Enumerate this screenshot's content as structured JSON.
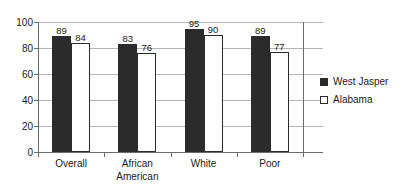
{
  "chart_data": {
    "type": "bar",
    "title": "",
    "subtitle": "",
    "xlabel": "",
    "ylabel": "",
    "categories": [
      "Overall",
      "African American",
      "White",
      "Poor"
    ],
    "category_lines": [
      [
        "Overall"
      ],
      [
        "African",
        "American"
      ],
      [
        "White"
      ],
      [
        "Poor"
      ]
    ],
    "series": [
      {
        "name": "West Jasper",
        "values": [
          89,
          83,
          95,
          89
        ],
        "color": "#2b2b2b",
        "swatch": "filled"
      },
      {
        "name": "Alabama",
        "values": [
          84,
          76,
          90,
          77
        ],
        "color": "#ffffff",
        "swatch": "outline"
      }
    ],
    "ylim": [
      0,
      100
    ],
    "yticks": [
      0,
      20,
      40,
      60,
      80,
      100
    ],
    "ytick_labels": [
      "0",
      "20",
      "40",
      "60",
      "80",
      "100"
    ],
    "grid": true,
    "grid_axis": "y",
    "legend_position": "right",
    "data_labels": true,
    "axis_color": "#6b6b6b",
    "gridline_color": "#b5b5b5",
    "text_color": "#1a1a1a",
    "background": "#ffffff"
  }
}
